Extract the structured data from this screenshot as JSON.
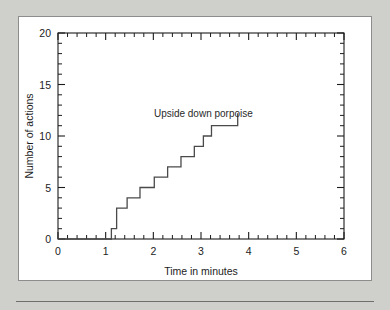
{
  "chart_data": {
    "type": "line",
    "title": "",
    "xlabel": "Time in minutes",
    "ylabel": "Number of actions",
    "xlim": [
      0,
      6
    ],
    "ylim": [
      0,
      20
    ],
    "x_major_ticks": [
      0,
      1,
      2,
      3,
      4,
      5,
      6
    ],
    "x_major_tick_labels": [
      "0",
      "1",
      "2",
      "3",
      "4",
      "5",
      "6"
    ],
    "x_minor_step": 0.2,
    "y_major_ticks": [
      0,
      5,
      10,
      15,
      20
    ],
    "y_major_tick_labels": [
      "0",
      "5",
      "10",
      "15",
      "20"
    ],
    "y_minor_step": 1,
    "grid": false,
    "legend": false,
    "frame": "box",
    "tick_direction": "in",
    "series": [
      {
        "name": "Upside down porpoise",
        "style": "step-post",
        "x": [
          0.0,
          1.12,
          1.12,
          1.23,
          1.23,
          1.45,
          1.45,
          1.72,
          1.72,
          2.02,
          2.02,
          2.3,
          2.3,
          2.58,
          2.58,
          2.86,
          2.86,
          3.05,
          3.05,
          3.22,
          3.22,
          3.4,
          3.4,
          3.58,
          3.58,
          3.78,
          3.78
        ],
        "y": [
          0,
          0,
          1,
          1,
          3,
          3,
          4,
          4,
          5,
          5,
          6,
          6,
          7,
          7,
          8,
          8,
          9,
          9,
          10,
          10,
          11,
          11,
          12,
          12,
          13,
          13,
          14
        ],
        "step_points": [
          {
            "x": 0.0,
            "y": 0
          },
          {
            "x": 1.12,
            "y": 1
          },
          {
            "x": 1.23,
            "y": 3
          },
          {
            "x": 1.45,
            "y": 4
          },
          {
            "x": 1.72,
            "y": 5
          },
          {
            "x": 2.02,
            "y": 6
          },
          {
            "x": 2.3,
            "y": 7
          },
          {
            "x": 2.58,
            "y": 8
          },
          {
            "x": 2.86,
            "y": 9
          },
          {
            "x": 3.05,
            "y": 10
          },
          {
            "x": 3.22,
            "y": 11
          }
        ]
      }
    ],
    "annotations": [
      {
        "text": "Upside down porpoise",
        "x": 3.05,
        "y": 11.8,
        "anchor": "middle"
      }
    ]
  }
}
